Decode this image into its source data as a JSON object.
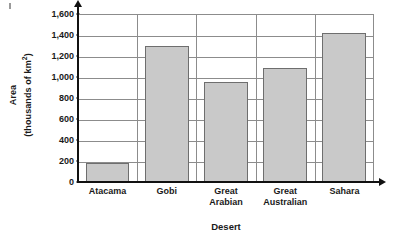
{
  "chart_data": {
    "type": "bar",
    "title": "",
    "xlabel": "Desert",
    "ylabel_line1": "Area",
    "ylabel_line2_pre": "(thousands of km",
    "ylabel_line2_sup": "2",
    "ylabel_line2_post": ")",
    "categories": [
      "Atacama",
      "Gobi",
      "Great Arabian",
      "Great Australian",
      "Sahara"
    ],
    "category_lines": [
      [
        "Atacama"
      ],
      [
        "Gobi"
      ],
      [
        "Great",
        "Arabian"
      ],
      [
        "Great",
        "Australian"
      ],
      [
        "Sahara"
      ]
    ],
    "values": [
      185,
      1300,
      950,
      1090,
      1420
    ],
    "ylim": [
      0,
      1600
    ],
    "yticks": [
      0,
      200,
      400,
      600,
      800,
      1000,
      1200,
      1400,
      1600
    ],
    "ytick_labels": [
      "0",
      "200",
      "400",
      "600",
      "800",
      "1,000",
      "1,200",
      "1,400",
      "1,600"
    ],
    "grid": "horizontal-and-vertical",
    "legend": "none",
    "bar_fill_color": "#c9c9c9",
    "bar_border_color": "#6e6e6e",
    "gridline_color": "#8c8c8c",
    "axis_color": "#111111"
  }
}
